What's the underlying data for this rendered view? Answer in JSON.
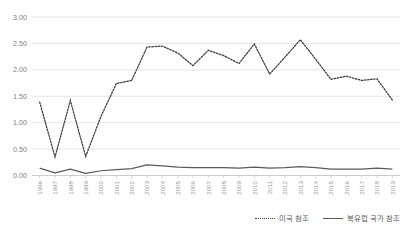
{
  "chart_data": {
    "type": "line",
    "title": "",
    "xlabel": "",
    "ylabel": "",
    "ylim": [
      0.0,
      3.0
    ],
    "ytick_labels": [
      "0.00",
      "0.50",
      "1.00",
      "1.50",
      "2.00",
      "2.50",
      "3.00"
    ],
    "ytick_values": [
      0.0,
      0.5,
      1.0,
      1.5,
      2.0,
      2.5,
      3.0
    ],
    "grid": true,
    "legend_position": "bottom-right",
    "categories": [
      "1996",
      "1997",
      "1998",
      "1999",
      "2000",
      "2001",
      "2002",
      "2003",
      "2004",
      "2005",
      "2006",
      "2007",
      "2008",
      "2009",
      "2010",
      "2011",
      "2012",
      "2013",
      "2014",
      "2015",
      "2016",
      "2017",
      "2018",
      "2019"
    ],
    "series": [
      {
        "name": "미국 참조",
        "style": "dotted",
        "color": "#3a3a3a",
        "values": [
          1.39,
          0.35,
          1.42,
          0.36,
          1.12,
          1.74,
          1.8,
          2.43,
          2.45,
          2.32,
          2.08,
          2.37,
          2.27,
          2.12,
          2.49,
          1.92,
          2.24,
          2.57,
          2.2,
          1.82,
          1.88,
          1.8,
          1.83,
          1.43
        ]
      },
      {
        "name": "북유럽 국가 참조",
        "style": "solid",
        "color": "#5a5a5a",
        "values": [
          0.14,
          0.05,
          0.12,
          0.04,
          0.09,
          0.11,
          0.13,
          0.2,
          0.18,
          0.16,
          0.15,
          0.15,
          0.15,
          0.14,
          0.16,
          0.14,
          0.15,
          0.17,
          0.15,
          0.12,
          0.12,
          0.12,
          0.14,
          0.12
        ]
      }
    ]
  },
  "legend": {
    "items": [
      {
        "label": "미국 참조",
        "style": "dotted"
      },
      {
        "label": "북유럽 국가 참조",
        "style": "solid"
      }
    ]
  }
}
